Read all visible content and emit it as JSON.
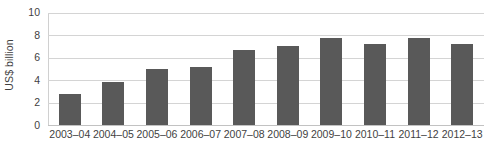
{
  "chart_data": {
    "type": "bar",
    "title": "",
    "subtitle": "",
    "xlabel": "",
    "ylabel": "US$ billion",
    "categories": [
      "2003–04",
      "2004–05",
      "2005–06",
      "2006–07",
      "2007–08",
      "2008–09",
      "2009–10",
      "2010–11",
      "2011–12",
      "2012–13"
    ],
    "values": [
      2.8,
      3.8,
      5.0,
      5.2,
      6.7,
      7.0,
      7.7,
      7.2,
      7.7,
      7.2
    ],
    "series": [
      {
        "name": "US$ billion",
        "values": [
          2.8,
          3.8,
          5.0,
          5.2,
          6.7,
          7.0,
          7.7,
          7.2,
          7.7,
          7.2
        ]
      }
    ],
    "ylim": [
      0,
      10
    ],
    "yticks": [
      0,
      2,
      4,
      6,
      8,
      10
    ],
    "ytick_labels": [
      "0",
      "2",
      "4",
      "6",
      "8",
      "10"
    ],
    "grid": true,
    "grid_axis": "y",
    "legend": false,
    "legend_position": "none",
    "bar_color": "#595959",
    "grid_color": "#d4d4d4",
    "background_color": "#ffffff",
    "text_color": "#3f3f3f"
  }
}
